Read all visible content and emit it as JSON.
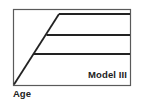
{
  "diagram": {
    "title": "Model III",
    "x_axis_label": "Age",
    "colors": {
      "frame": "#5a5a5a",
      "lines": "#222222",
      "background": "#ffffff"
    },
    "frame": {
      "x": 13,
      "y": 9,
      "width": 117,
      "height": 76
    },
    "diagonal": {
      "x1": 14,
      "y1": 84,
      "x2": 59,
      "y2": 14
    },
    "plateaus": [
      {
        "name": "upper",
        "x1": 59,
        "y": 14,
        "x2": 130
      },
      {
        "name": "middle",
        "x1": 46,
        "y": 35,
        "x2": 130
      },
      {
        "name": "lower",
        "x1": 34,
        "y": 54,
        "x2": 130
      }
    ]
  }
}
